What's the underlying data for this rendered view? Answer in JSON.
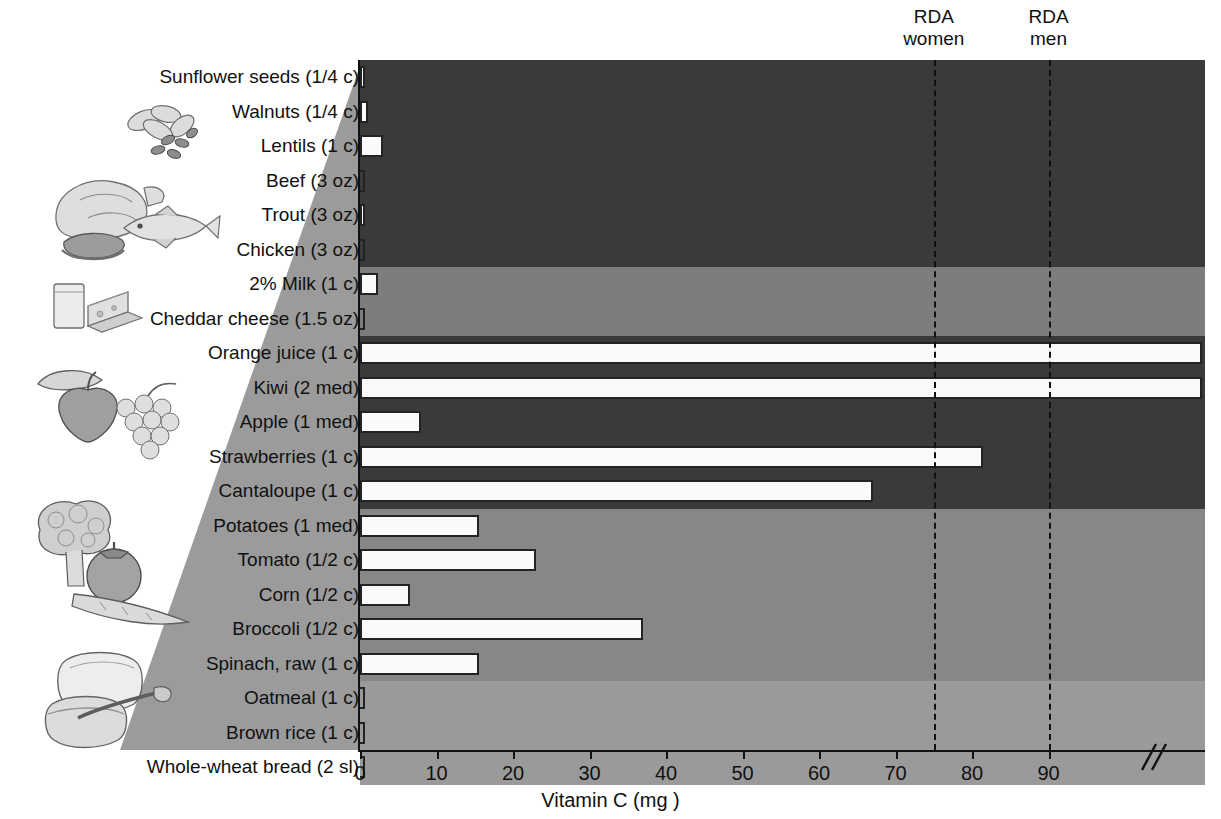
{
  "chart_data": {
    "type": "bar",
    "orientation": "horizontal",
    "title": "",
    "xlabel": "Vitamin C (mg )",
    "ylabel": "",
    "xlim": [
      0,
      110
    ],
    "xticks": [
      0,
      10,
      20,
      30,
      40,
      50,
      60,
      70,
      80,
      90
    ],
    "axis_break": true,
    "axis_break_note": "x-axis is broken after 90 mg; Orange juice and Kiwi bars run past the break",
    "grid": false,
    "legend": "none",
    "categories": [
      "Sunflower seeds (1/4 c)",
      "Walnuts (1/4 c)",
      "Lentils (1 c)",
      "Beef (3 oz)",
      "Trout (3 oz)",
      "Chicken (3 oz)",
      "2% Milk (1 c)",
      "Cheddar cheese (1.5 oz)",
      "Orange juice (1 c)",
      "Kiwi (2 med)",
      "Apple (1 med)",
      "Strawberries (1 c)",
      "Cantaloupe (1 c)",
      "Potatoes (1 med)",
      "Tomato (1/2 c)",
      "Corn (1/2 c)",
      "Broccoli (1/2 c)",
      "Spinach, raw (1 c)",
      "Oatmeal (1 c)",
      "Brown rice (1 c)",
      "Whole-wheat bread (2 sl)"
    ],
    "values": [
      0.5,
      1.0,
      3.0,
      0,
      0.5,
      0,
      2.3,
      0,
      110,
      110,
      8,
      81.5,
      67,
      15.5,
      23,
      6.5,
      37,
      15.5,
      0,
      0,
      0
    ],
    "annotations": [
      {
        "label": "RDA\nwomen",
        "line1": "RDA",
        "line2": "women",
        "x": 75
      },
      {
        "label": "RDA\nmen",
        "line1": "RDA",
        "line2": "men",
        "x": 90
      }
    ],
    "food_group_bands": [
      {
        "name": "protein-foods",
        "rows": [
          0,
          5
        ],
        "color": "#3a3a3a"
      },
      {
        "name": "dairy",
        "rows": [
          6,
          7
        ],
        "color": "#7d7d7d"
      },
      {
        "name": "fruits",
        "rows": [
          8,
          12
        ],
        "color": "#3a3a3a"
      },
      {
        "name": "vegetables",
        "rows": [
          13,
          17
        ],
        "color": "#878787"
      },
      {
        "name": "grains",
        "rows": [
          18,
          20
        ],
        "color": "#9a9a9a"
      }
    ]
  },
  "colors": {
    "band_dark": "#3a3a3a",
    "band_medium": "#7d7d7d",
    "band_vegetables": "#878787",
    "band_grains": "#9a9a9a",
    "wedge": "#9b9b9b",
    "bar_fill": "#fafafa",
    "bar_stroke": "#232323",
    "axis": "#111111",
    "rda_line": "#111111"
  },
  "axis": {
    "title": "Vitamin C (mg )",
    "tick_labels": [
      "0",
      "10",
      "20",
      "30",
      "40",
      "50",
      "60",
      "70",
      "80",
      "90"
    ]
  },
  "annotations": {
    "rda_women_line1": "RDA",
    "rda_women_line2": "women",
    "rda_men_line1": "RDA",
    "rda_men_line2": "men"
  },
  "illustrations": [
    {
      "name": "nuts-and-seeds-illustration"
    },
    {
      "name": "meat-poultry-fish-illustration"
    },
    {
      "name": "dairy-milk-cheese-illustration"
    },
    {
      "name": "fruits-illustration"
    },
    {
      "name": "vegetables-illustration"
    },
    {
      "name": "grains-bread-cereal-illustration"
    }
  ]
}
